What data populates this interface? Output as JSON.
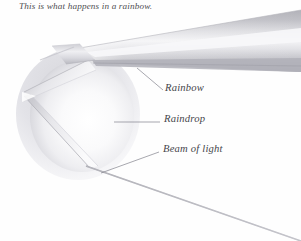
{
  "figure": {
    "title": "This is what happens in a rainbow.",
    "background_color": "#fefefe",
    "width": 301,
    "height": 241,
    "labels": {
      "rainbow": "Rainbow",
      "raindrop": "Raindrop",
      "beam_of_light": "Beam of light"
    },
    "colors": {
      "text": "#45454b",
      "title_text": "#4e4e52",
      "leader_line": "#8a8a93",
      "beam_line": "#9a9aa2",
      "band_dark": "#b6b6bc",
      "band_mid": "#c9c9ce",
      "band_light": "#ececef",
      "drop_edge": "#c2c2c8",
      "drop_body": "#f4f4f6"
    },
    "elements": {
      "raindrop_sphere": "sphere-shape",
      "rainbow_band": "dispersed-light-band",
      "incident_beam": "beam-line",
      "internal_reflection": "refraction-path"
    }
  }
}
